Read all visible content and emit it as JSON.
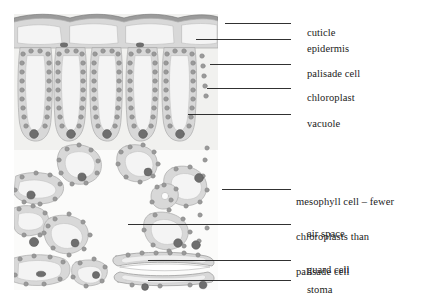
{
  "diagram": {
    "type": "labelled-biological-diagram",
    "colors": {
      "cell_wall": "#d6d6d6",
      "cell_wall_outline": "#a8a8a8",
      "chloroplast": "#9a9a9a",
      "chloroplast_outline": "#868686",
      "nucleus": "#6e6e6e",
      "vacuole": "#f4f4f4",
      "cuticle": "#8d8d8d",
      "background_tint": "#f0f0ee",
      "air_space": "#ffffff",
      "leader_line": "#1b1b1b",
      "text": "#1b1b1b"
    },
    "canvas": {
      "width": 425,
      "height": 305
    },
    "art_bounds": {
      "x": 14,
      "y": 12,
      "width": 204,
      "height": 278
    }
  },
  "labels": [
    {
      "id": "cuticle",
      "text": "cuticle",
      "text_x": 296,
      "text_y": 20,
      "lines": [
        "cuticle"
      ],
      "leader": {
        "x1": 225,
        "y1": 23,
        "x2": 291,
        "y2": 23
      }
    },
    {
      "id": "epidermis",
      "text": "epidermis",
      "text_x": 296,
      "text_y": 36,
      "lines": [
        "epidermis"
      ],
      "leader": {
        "x1": 196,
        "y1": 39,
        "x2": 291,
        "y2": 39
      }
    },
    {
      "id": "palisade-cell",
      "text": "palisade cell",
      "text_x": 296,
      "text_y": 61,
      "lines": [
        "palisade cell"
      ],
      "leader": {
        "x1": 210,
        "y1": 64,
        "x2": 291,
        "y2": 64
      }
    },
    {
      "id": "chloroplast",
      "text": "chloroplast",
      "text_x": 296,
      "text_y": 85,
      "lines": [
        "chloroplast"
      ],
      "leader": {
        "x1": 207,
        "y1": 88,
        "x2": 291,
        "y2": 88
      }
    },
    {
      "id": "vacuole",
      "text": "vacuole",
      "text_x": 296,
      "text_y": 111,
      "lines": [
        "vacuole"
      ],
      "leader": {
        "x1": 188,
        "y1": 114,
        "x2": 291,
        "y2": 114
      }
    },
    {
      "id": "mesophyll-cell",
      "text": "mesophyll cell – fewer chloroplasts than palisade cell",
      "text_x": 296,
      "text_y": 174,
      "lines": [
        "mesophyll cell – fewer",
        "chloroplasts than",
        "palisade cell"
      ],
      "leader": {
        "x1": 222,
        "y1": 189,
        "x2": 291,
        "y2": 189
      }
    },
    {
      "id": "air-space",
      "text": "air space",
      "text_x": 296,
      "text_y": 221,
      "lines": [
        "air space"
      ],
      "leader": {
        "x1": 128,
        "y1": 224,
        "x2": 291,
        "y2": 224
      }
    },
    {
      "id": "guard-cell",
      "text": "guard cell",
      "text_x": 296,
      "text_y": 257,
      "lines": [
        "guard cell"
      ],
      "leader": {
        "x1": 148,
        "y1": 260,
        "x2": 291,
        "y2": 260
      }
    },
    {
      "id": "stoma",
      "text": "stoma",
      "text_x": 296,
      "text_y": 277,
      "lines": [
        "stoma"
      ],
      "leader": {
        "x1": 148,
        "y1": 280,
        "x2": 291,
        "y2": 280
      }
    }
  ],
  "structures": {
    "cuticle_layer": "wavy dark band across top of leaf",
    "upper_epidermis": "row of three large clear rectangular cells",
    "palisade_layer": "four tall columnar cells packed with chloroplasts, nucleus at base",
    "spongy_mesophyll": "irregular rounded cells with fewer chloroplasts separated by air spaces",
    "lower_epidermis": "flattened cells at base",
    "stomatal_pore": "gap between two guard cells at lower surface"
  }
}
